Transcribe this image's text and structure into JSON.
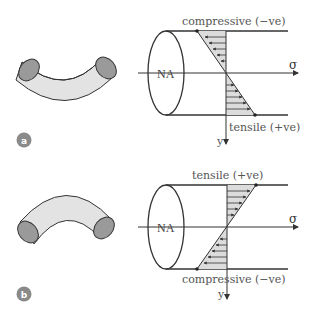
{
  "figure": {
    "panels": [
      {
        "id": "a",
        "badge": "a",
        "na_label": "NA",
        "axis_x_label": "σ",
        "axis_y_label": "y",
        "top_label": "compressive (−ve)",
        "bottom_label": "tensile (+ve)",
        "top_stress": "compressive",
        "bottom_stress": "tensile",
        "beam_bend": "sagging (ends up)"
      },
      {
        "id": "b",
        "badge": "b",
        "na_label": "NA",
        "axis_x_label": "σ",
        "axis_y_label": "y",
        "top_label": "tensile (+ve)",
        "bottom_label": "compressive (−ve)",
        "top_stress": "tensile",
        "bottom_stress": "compressive",
        "beam_bend": "hogging (ends down)"
      }
    ],
    "colors": {
      "stroke": "#333333",
      "tube_fill": "#e3e3e3",
      "tube_end_fill": "#9a9a9a",
      "stress_fill": "#dcdcdc",
      "badge_fill": "#8a8a8a",
      "label": "#555555"
    }
  }
}
